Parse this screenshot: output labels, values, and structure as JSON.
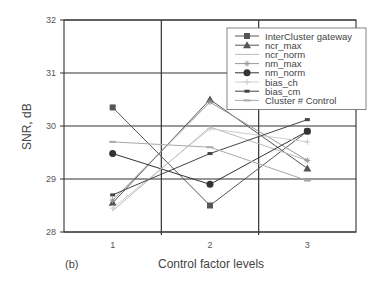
{
  "chart_data": {
    "type": "line",
    "title": "",
    "xlabel": "Control factor levels",
    "ylabel": "SNR, dB",
    "panel_label": "(b)",
    "categories": [
      "1",
      "2",
      "3"
    ],
    "ylim": [
      28,
      32
    ],
    "yticks": [
      "28",
      "29",
      "30",
      "31",
      "32"
    ],
    "grid": true,
    "legend_position": "upper right",
    "series": [
      {
        "name": "InterCluster gateway",
        "marker": "square",
        "color": "#555555",
        "values": [
          30.35,
          28.5,
          29.9
        ]
      },
      {
        "name": "ncr_max",
        "marker": "triangle",
        "color": "#555555",
        "values": [
          28.55,
          30.5,
          29.2
        ]
      },
      {
        "name": "ncr_norm",
        "marker": "none",
        "color": "#bbbbbb",
        "values": [
          28.4,
          29.98,
          29.35
        ]
      },
      {
        "name": "nm_max",
        "marker": "star",
        "color": "#999999",
        "values": [
          28.6,
          30.45,
          29.35
        ]
      },
      {
        "name": "nm_norm",
        "marker": "circle",
        "color": "#333333",
        "values": [
          29.48,
          28.9,
          29.9
        ]
      },
      {
        "name": "bias_ch",
        "marker": "plus",
        "color": "#cccccc",
        "values": [
          28.45,
          29.95,
          29.7
        ]
      },
      {
        "name": "bias_cm",
        "marker": "dot",
        "color": "#444444",
        "values": [
          28.7,
          29.48,
          30.12
        ]
      },
      {
        "name": "Cluster # Control",
        "marker": "dash",
        "color": "#aaaaaa",
        "values": [
          29.7,
          29.6,
          28.97
        ]
      }
    ]
  }
}
